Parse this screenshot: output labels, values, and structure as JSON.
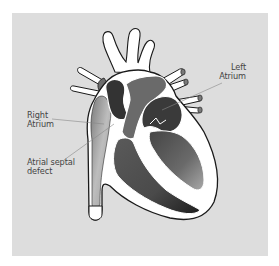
{
  "figure": {
    "colors": {
      "frame": "#ffffff",
      "panel_background": "#dddddd",
      "outline": "#1a1a1a",
      "vessel_wall": "#ffffff",
      "chamber_dark": "#333333",
      "chamber_mid": "#5a5a5a",
      "chamber_light": "#8a8a8a",
      "label_text": "#444444",
      "leader_line": "#888888"
    },
    "labels": {
      "left_atrium": {
        "line1": "Left",
        "line2": "Atrium"
      },
      "right_atrium": {
        "line1": "Right",
        "line2": "Atrium"
      },
      "atrial_septal_defect": {
        "line1": "Atrial septal",
        "line2": "defect"
      }
    },
    "structures": [
      "aortic-arch-branches",
      "pulmonary-artery",
      "pulmonary-veins",
      "superior-vena-cava",
      "inferior-vena-cava",
      "right-atrium",
      "left-atrium",
      "right-ventricle",
      "left-ventricle",
      "atrial-septum"
    ]
  }
}
